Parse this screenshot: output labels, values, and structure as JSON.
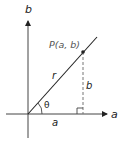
{
  "diagram": {
    "type": "polar-coordinate-triangle",
    "axes": {
      "horizontal_label": "a",
      "vertical_label": "b"
    },
    "point_label": "P(a, b)",
    "labels": {
      "radius": "r",
      "angle": "θ",
      "opposite_side": "b",
      "adjacent_side": "a"
    },
    "colors": {
      "line": "#222222",
      "axis": "#444444",
      "dashed": "#777777"
    }
  }
}
